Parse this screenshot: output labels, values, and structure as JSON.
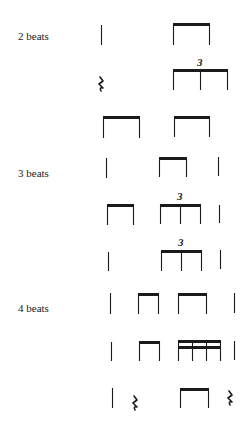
{
  "labels": {
    "two_beats": "2 beats",
    "three_beats": "3 beats",
    "four_beats": "4 beats"
  },
  "triplet_mark": "3",
  "rest_glyph": "𝄽",
  "rows": [
    {
      "group": "2 beats",
      "pattern": [
        "quarter",
        "eighth-pair"
      ]
    },
    {
      "group": "2 beats",
      "pattern": [
        "quarter-rest",
        "eighth-triplet"
      ]
    },
    {
      "group": "2 beats",
      "pattern": [
        "eighth-pair",
        "eighth-pair"
      ]
    },
    {
      "group": "3 beats",
      "pattern": [
        "quarter",
        "eighth-pair",
        "quarter"
      ]
    },
    {
      "group": "3 beats",
      "pattern": [
        "eighth-pair",
        "eighth-triplet",
        "quarter"
      ]
    },
    {
      "group": "3 beats",
      "pattern": [
        "quarter",
        "eighth-triplet",
        "quarter"
      ]
    },
    {
      "group": "4 beats",
      "pattern": [
        "quarter",
        "eighth-pair",
        "eighth-pair",
        "quarter"
      ]
    },
    {
      "group": "4 beats",
      "pattern": [
        "quarter",
        "eighth-pair",
        "sixteenth-group",
        "quarter"
      ]
    },
    {
      "group": "4 beats",
      "pattern": [
        "quarter",
        "quarter-rest",
        "eighth-pair",
        "quarter-rest"
      ]
    }
  ]
}
